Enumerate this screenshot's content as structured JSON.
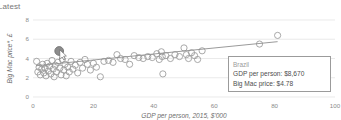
{
  "page": {
    "corner_label": "Latest"
  },
  "tooltip": {
    "title": "Brazil",
    "gdp_row": "GDP per person: $8,670",
    "price_row": "Big Mac price: $4.78",
    "border_color": "#9b9b9b"
  },
  "colors": {
    "point_stroke": "#9a9a9a",
    "highlight_fill": "#8c8c8c",
    "trend_line": "#8f8f8f",
    "grid": "#dcdcdc",
    "text": "#6e6e6e"
  },
  "chart_data": {
    "type": "scatter",
    "title": "",
    "xlabel": "GDP per person, 2015, $'000",
    "ylabel": "Big Mac price*, £",
    "xlim": [
      0,
      100
    ],
    "ylim": [
      0,
      8
    ],
    "xticks": [
      0,
      20,
      40,
      60,
      80,
      100
    ],
    "yticks": [
      0,
      2,
      4,
      6,
      8
    ],
    "grid": "horizontal",
    "legend": "none",
    "highlight": {
      "label": "Brazil",
      "x": 8.67,
      "y": 4.78
    },
    "trendline": {
      "x": [
        1,
        81
      ],
      "y": [
        3.25,
        5.75
      ]
    },
    "points": [
      {
        "x": 1.2,
        "y": 3.7
      },
      {
        "x": 1.6,
        "y": 2.6
      },
      {
        "x": 2.0,
        "y": 3.1
      },
      {
        "x": 2.4,
        "y": 2.3
      },
      {
        "x": 2.9,
        "y": 2.9
      },
      {
        "x": 3.2,
        "y": 3.4
      },
      {
        "x": 3.6,
        "y": 2.5
      },
      {
        "x": 4.0,
        "y": 3.0
      },
      {
        "x": 4.3,
        "y": 2.2
      },
      {
        "x": 4.7,
        "y": 3.5
      },
      {
        "x": 5.1,
        "y": 2.7
      },
      {
        "x": 5.5,
        "y": 3.2
      },
      {
        "x": 5.9,
        "y": 2.4
      },
      {
        "x": 6.3,
        "y": 3.8
      },
      {
        "x": 6.7,
        "y": 2.9
      },
      {
        "x": 7.0,
        "y": 2.1
      },
      {
        "x": 7.4,
        "y": 3.3
      },
      {
        "x": 7.8,
        "y": 2.6
      },
      {
        "x": 8.2,
        "y": 3.6
      },
      {
        "x": 8.9,
        "y": 3.0
      },
      {
        "x": 9.3,
        "y": 2.3
      },
      {
        "x": 9.7,
        "y": 3.9
      },
      {
        "x": 10.2,
        "y": 2.8
      },
      {
        "x": 10.6,
        "y": 3.4
      },
      {
        "x": 11.0,
        "y": 2.2
      },
      {
        "x": 11.5,
        "y": 3.1
      },
      {
        "x": 12.0,
        "y": 2.6
      },
      {
        "x": 12.6,
        "y": 3.7
      },
      {
        "x": 13.2,
        "y": 2.9
      },
      {
        "x": 14.0,
        "y": 3.3
      },
      {
        "x": 14.8,
        "y": 2.5
      },
      {
        "x": 15.6,
        "y": 3.6
      },
      {
        "x": 16.4,
        "y": 3.0
      },
      {
        "x": 17.2,
        "y": 3.9
      },
      {
        "x": 18.0,
        "y": 3.4
      },
      {
        "x": 19.0,
        "y": 2.8
      },
      {
        "x": 20.0,
        "y": 3.5
      },
      {
        "x": 21.0,
        "y": 3.1
      },
      {
        "x": 22.3,
        "y": 2.1
      },
      {
        "x": 23.5,
        "y": 3.7
      },
      {
        "x": 25.0,
        "y": 3.8
      },
      {
        "x": 26.5,
        "y": 3.6
      },
      {
        "x": 27.8,
        "y": 4.4
      },
      {
        "x": 29.0,
        "y": 4.0
      },
      {
        "x": 30.5,
        "y": 3.9
      },
      {
        "x": 32.0,
        "y": 3.4
      },
      {
        "x": 33.5,
        "y": 4.3
      },
      {
        "x": 35.0,
        "y": 4.1
      },
      {
        "x": 36.5,
        "y": 4.0
      },
      {
        "x": 38.0,
        "y": 4.2
      },
      {
        "x": 39.5,
        "y": 4.1
      },
      {
        "x": 41.0,
        "y": 4.5
      },
      {
        "x": 41.8,
        "y": 3.9
      },
      {
        "x": 42.5,
        "y": 4.7
      },
      {
        "x": 42.8,
        "y": 4.2
      },
      {
        "x": 43.0,
        "y": 2.4
      },
      {
        "x": 44.0,
        "y": 4.3
      },
      {
        "x": 45.5,
        "y": 4.0
      },
      {
        "x": 47.0,
        "y": 4.4
      },
      {
        "x": 48.5,
        "y": 4.2
      },
      {
        "x": 50.0,
        "y": 5.1
      },
      {
        "x": 50.8,
        "y": 4.4
      },
      {
        "x": 51.5,
        "y": 4.0
      },
      {
        "x": 52.5,
        "y": 4.6
      },
      {
        "x": 53.5,
        "y": 4.3
      },
      {
        "x": 54.5,
        "y": 3.9
      },
      {
        "x": 56.0,
        "y": 4.8
      },
      {
        "x": 75.0,
        "y": 5.5
      },
      {
        "x": 81.0,
        "y": 6.4
      }
    ]
  }
}
